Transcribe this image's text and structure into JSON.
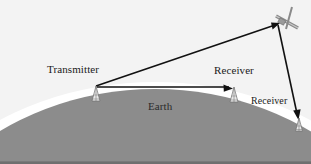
{
  "figure": {
    "background_color": "#f2f2f2",
    "earth_color": "#8c8c8c",
    "atmosphere_color": "#ffffff",
    "line_color": "#111111",
    "width": 311,
    "height": 164
  },
  "labels": {
    "transmitter": "Transmitter",
    "receiver_terrestrial": "Receiver",
    "receiver_satellite": "Receiver",
    "earth": "Earth"
  },
  "nodes": [
    {
      "name": "transmitter-antenna",
      "label": "Transmitter",
      "x": 96,
      "y": 86
    },
    {
      "name": "receiver-antenna-terrestrial",
      "label": "Receiver",
      "x": 234,
      "y": 87
    },
    {
      "name": "receiver-antenna-satellite",
      "label": "Receiver",
      "x": 299,
      "y": 118
    },
    {
      "name": "satellite",
      "label": "",
      "x": 281,
      "y": 22
    }
  ],
  "links": [
    {
      "name": "uplink",
      "from": "transmitter-antenna",
      "to": "satellite"
    },
    {
      "name": "downlink",
      "from": "satellite",
      "to": "receiver-antenna-satellite"
    },
    {
      "name": "line-of-sight",
      "from": "transmitter-antenna",
      "to": "receiver-antenna-terrestrial"
    }
  ]
}
